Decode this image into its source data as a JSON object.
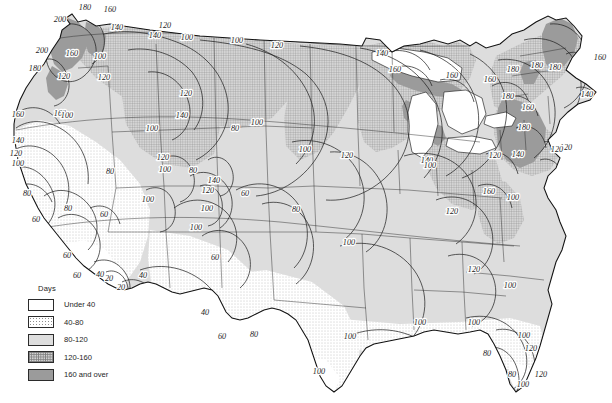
{
  "figure": {
    "kind": "isopleth-contour-map",
    "region": "Contiguous United States",
    "units": "Days"
  },
  "legend": {
    "title": "Days",
    "classes": [
      {
        "label": "Under 40",
        "pattern": "blank-white",
        "color": "#ffffff",
        "min": 0,
        "max": 40
      },
      {
        "label": "40-80",
        "pattern": "sparse-dots",
        "color": "#f2f2f2",
        "min": 40,
        "max": 80
      },
      {
        "label": "80-120",
        "pattern": "light-gray",
        "color": "#dedede",
        "min": 80,
        "max": 120
      },
      {
        "label": "120-160",
        "pattern": "crosshatch",
        "color": "#d2d2d2",
        "min": 120,
        "max": 160
      },
      {
        "label": "160 and over",
        "pattern": "solid-gray",
        "color": "#9b9b9b",
        "min": 160,
        "max": null
      }
    ]
  },
  "chart_data": {
    "type": "heatmap",
    "title": "Days",
    "xlabel": "",
    "ylabel": "",
    "contour_interval": 20,
    "contour_levels": [
      20,
      40,
      60,
      80,
      100,
      120,
      140,
      160,
      180,
      200
    ],
    "legend_position": "bottom-left",
    "grid": false,
    "contour_labels": [
      {
        "value": 180,
        "x": 85,
        "y": 10
      },
      {
        "value": 160,
        "x": 110,
        "y": 12
      },
      {
        "value": 200,
        "x": 60,
        "y": 22
      },
      {
        "value": 140,
        "x": 117,
        "y": 30
      },
      {
        "value": 120,
        "x": 165,
        "y": 28
      },
      {
        "value": 140,
        "x": 155,
        "y": 38
      },
      {
        "value": 100,
        "x": 187,
        "y": 40
      },
      {
        "value": 100,
        "x": 237,
        "y": 43
      },
      {
        "value": 120,
        "x": 277,
        "y": 48
      },
      {
        "value": 200,
        "x": 42,
        "y": 53
      },
      {
        "value": 160,
        "x": 72,
        "y": 56
      },
      {
        "value": 100,
        "x": 100,
        "y": 59
      },
      {
        "value": 180,
        "x": 35,
        "y": 71
      },
      {
        "value": 120,
        "x": 64,
        "y": 79
      },
      {
        "value": 120,
        "x": 104,
        "y": 80
      },
      {
        "value": 140,
        "x": 382,
        "y": 56
      },
      {
        "value": 160,
        "x": 395,
        "y": 72
      },
      {
        "value": 160,
        "x": 452,
        "y": 78
      },
      {
        "value": 120,
        "x": 186,
        "y": 96
      },
      {
        "value": 140,
        "x": 182,
        "y": 118
      },
      {
        "value": 160,
        "x": 60,
        "y": 116
      },
      {
        "value": 100,
        "x": 67,
        "y": 118
      },
      {
        "value": 160,
        "x": 18,
        "y": 117
      },
      {
        "value": 100,
        "x": 152,
        "y": 131
      },
      {
        "value": 80,
        "x": 235,
        "y": 131
      },
      {
        "value": 100,
        "x": 257,
        "y": 125
      },
      {
        "value": 140,
        "x": 18,
        "y": 143
      },
      {
        "value": 120,
        "x": 16,
        "y": 156
      },
      {
        "value": 100,
        "x": 18,
        "y": 166
      },
      {
        "value": 100,
        "x": 305,
        "y": 152
      },
      {
        "value": 120,
        "x": 347,
        "y": 158
      },
      {
        "value": 160,
        "x": 490,
        "y": 82
      },
      {
        "value": 180,
        "x": 513,
        "y": 72
      },
      {
        "value": 180,
        "x": 537,
        "y": 68
      },
      {
        "value": 180,
        "x": 555,
        "y": 70
      },
      {
        "value": 160,
        "x": 600,
        "y": 60
      },
      {
        "value": 140,
        "x": 587,
        "y": 97
      },
      {
        "value": 180,
        "x": 508,
        "y": 99
      },
      {
        "value": 160,
        "x": 528,
        "y": 110
      },
      {
        "value": 180,
        "x": 524,
        "y": 130
      },
      {
        "value": 140,
        "x": 518,
        "y": 157
      },
      {
        "value": 120,
        "x": 495,
        "y": 158
      },
      {
        "value": 120,
        "x": 566,
        "y": 150
      },
      {
        "value": 120,
        "x": 557,
        "y": 152
      },
      {
        "value": 140,
        "x": 427,
        "y": 163
      },
      {
        "value": 80,
        "x": 110,
        "y": 174
      },
      {
        "value": 100,
        "x": 165,
        "y": 172
      },
      {
        "value": 120,
        "x": 163,
        "y": 160
      },
      {
        "value": 80,
        "x": 193,
        "y": 173
      },
      {
        "value": 140,
        "x": 214,
        "y": 183
      },
      {
        "value": 120,
        "x": 208,
        "y": 193
      },
      {
        "value": 60,
        "x": 245,
        "y": 196
      },
      {
        "value": 100,
        "x": 207,
        "y": 211
      },
      {
        "value": 80,
        "x": 296,
        "y": 212
      },
      {
        "value": 100,
        "x": 430,
        "y": 168
      },
      {
        "value": 160,
        "x": 489,
        "y": 194
      },
      {
        "value": 120,
        "x": 452,
        "y": 214
      },
      {
        "value": 100,
        "x": 513,
        "y": 200
      },
      {
        "value": 80,
        "x": 27,
        "y": 196
      },
      {
        "value": 80,
        "x": 68,
        "y": 211
      },
      {
        "value": 60,
        "x": 104,
        "y": 217
      },
      {
        "value": 60,
        "x": 36,
        "y": 222
      },
      {
        "value": 100,
        "x": 148,
        "y": 202
      },
      {
        "value": 100,
        "x": 196,
        "y": 230
      },
      {
        "value": 100,
        "x": 349,
        "y": 245
      },
      {
        "value": 60,
        "x": 67,
        "y": 258
      },
      {
        "value": 60,
        "x": 77,
        "y": 278
      },
      {
        "value": 40,
        "x": 100,
        "y": 277
      },
      {
        "value": 20,
        "x": 109,
        "y": 281
      },
      {
        "value": 20,
        "x": 121,
        "y": 290
      },
      {
        "value": 40,
        "x": 143,
        "y": 278
      },
      {
        "value": 60,
        "x": 215,
        "y": 260
      },
      {
        "value": 40,
        "x": 205,
        "y": 315
      },
      {
        "value": 120,
        "x": 474,
        "y": 272
      },
      {
        "value": 100,
        "x": 510,
        "y": 288
      },
      {
        "value": 60,
        "x": 222,
        "y": 339
      },
      {
        "value": 80,
        "x": 254,
        "y": 337
      },
      {
        "value": 100,
        "x": 350,
        "y": 339
      },
      {
        "value": 100,
        "x": 420,
        "y": 325
      },
      {
        "value": 100,
        "x": 474,
        "y": 325
      },
      {
        "value": 100,
        "x": 524,
        "y": 338
      },
      {
        "value": 120,
        "x": 531,
        "y": 351
      },
      {
        "value": 80,
        "x": 487,
        "y": 356
      },
      {
        "value": 100,
        "x": 319,
        "y": 374
      },
      {
        "value": 80,
        "x": 512,
        "y": 377
      },
      {
        "value": 120,
        "x": 541,
        "y": 377
      },
      {
        "value": 100,
        "x": 523,
        "y": 387
      }
    ],
    "shaded_regions": [
      {
        "class": "160 and over",
        "areas": [
          "Olympic Peninsula WA",
          "Cascades WA/OR",
          "Lake Superior south shore",
          "northern Michigan",
          "Adirondacks NY",
          "northern Maine",
          "Green Mountains VT"
        ]
      },
      {
        "class": "120-160",
        "areas": [
          "Northern Rockies",
          "Minnesota",
          "Wisconsin",
          "Michigan",
          "Upper Ohio Valley",
          "New England",
          "Appalachians"
        ]
      },
      {
        "class": "80-120",
        "areas": [
          "Great Basin",
          "Great Plains",
          "Central Plains",
          "Mid-Atlantic",
          "Southeast interior"
        ]
      },
      {
        "class": "40-80",
        "areas": [
          "California Central Valley",
          "Southwest deserts",
          "Texas",
          "Gulf Coast"
        ]
      },
      {
        "class": "Under 40",
        "areas": [
          "Southern California",
          "Lower Colorado River valley",
          "South Texas",
          "South Florida"
        ]
      }
    ]
  }
}
